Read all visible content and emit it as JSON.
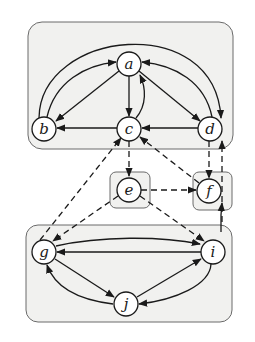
{
  "diagram": {
    "type": "directed-graph",
    "colors": {
      "stroke": "#1a1a1a",
      "cluster_fill": "#f1f1ef",
      "cluster_stroke": "#6a6a6a",
      "node_fill": "#ffffff"
    },
    "nodes": [
      {
        "id": "a",
        "label": "a",
        "x": 129,
        "y": 64
      },
      {
        "id": "b",
        "label": "b",
        "x": 44,
        "y": 129
      },
      {
        "id": "c",
        "label": "c",
        "x": 129,
        "y": 129
      },
      {
        "id": "d",
        "label": "d",
        "x": 210,
        "y": 129
      },
      {
        "id": "e",
        "label": "e",
        "x": 129,
        "y": 190
      },
      {
        "id": "f",
        "label": "f",
        "x": 209,
        "y": 191
      },
      {
        "id": "g",
        "label": "g",
        "x": 44,
        "y": 252
      },
      {
        "id": "i",
        "label": "i",
        "x": 213,
        "y": 252
      },
      {
        "id": "j",
        "label": "j",
        "x": 126,
        "y": 304
      }
    ],
    "clusters": [
      {
        "id": "top",
        "members": [
          "a",
          "b",
          "c",
          "d"
        ]
      },
      {
        "id": "e-box",
        "members": [
          "e"
        ]
      },
      {
        "id": "f-box",
        "members": [
          "f"
        ]
      },
      {
        "id": "bottom",
        "members": [
          "g",
          "i",
          "j"
        ]
      }
    ],
    "edges": [
      {
        "from": "a",
        "to": "b",
        "style": "solid"
      },
      {
        "from": "b",
        "to": "a",
        "style": "solid"
      },
      {
        "from": "a",
        "to": "c",
        "style": "solid"
      },
      {
        "from": "c",
        "to": "a",
        "style": "solid"
      },
      {
        "from": "a",
        "to": "d",
        "style": "solid"
      },
      {
        "from": "d",
        "to": "a",
        "style": "solid"
      },
      {
        "from": "b",
        "to": "d",
        "style": "solid"
      },
      {
        "from": "c",
        "to": "b",
        "style": "solid"
      },
      {
        "from": "d",
        "to": "c",
        "style": "solid"
      },
      {
        "from": "c",
        "to": "e",
        "style": "dashed"
      },
      {
        "from": "d",
        "to": "f",
        "style": "dashed"
      },
      {
        "from": "f",
        "to": "d",
        "style": "dashed"
      },
      {
        "from": "f",
        "to": "c",
        "style": "dashed"
      },
      {
        "from": "g",
        "to": "c",
        "style": "dashed"
      },
      {
        "from": "e",
        "to": "f",
        "style": "dashed"
      },
      {
        "from": "e",
        "to": "g",
        "style": "dashed"
      },
      {
        "from": "e",
        "to": "i",
        "style": "dashed"
      },
      {
        "from": "i",
        "to": "f",
        "style": "solid"
      },
      {
        "from": "g",
        "to": "i",
        "style": "solid"
      },
      {
        "from": "i",
        "to": "g",
        "style": "solid"
      },
      {
        "from": "g",
        "to": "j",
        "style": "solid"
      },
      {
        "from": "j",
        "to": "g",
        "style": "solid"
      },
      {
        "from": "j",
        "to": "i",
        "style": "solid"
      },
      {
        "from": "i",
        "to": "j",
        "style": "solid"
      }
    ]
  }
}
